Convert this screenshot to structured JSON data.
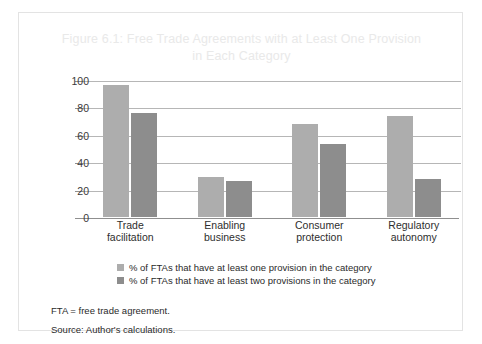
{
  "figure": {
    "title": "Figure 6.1: Free Trade Agreements with at Least One Provision\nin Each Category",
    "title_color": "#e9e9e9",
    "notes": [
      "FTA = free trade agreement.",
      "Source: Author's calculations."
    ]
  },
  "chart_data": {
    "type": "bar",
    "title": "Figure 6.1: Free Trade Agreements with at Least One Provision in Each Category",
    "xlabel": "",
    "ylabel": "",
    "ylim": [
      0,
      100
    ],
    "yticks": [
      0,
      20,
      40,
      60,
      80,
      100
    ],
    "ytick_labels": [
      "0",
      "20",
      "40",
      "60",
      "80",
      "100"
    ],
    "grid": true,
    "legend_position": "bottom",
    "categories": [
      "Trade\nfacilitation",
      "Enabling\nbusiness",
      "Consumer\nprotection",
      "Regulatory\nautonomy"
    ],
    "series": [
      {
        "name": "% of FTAs that have at least one provision in the category",
        "color": "#adadad",
        "values": [
          96,
          29,
          68,
          74
        ]
      },
      {
        "name": "% of FTAs that have at least two provisions in the category",
        "color": "#8d8d8d",
        "values": [
          76,
          26,
          53,
          28
        ]
      }
    ]
  }
}
